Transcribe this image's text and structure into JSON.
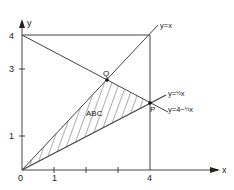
{
  "axes": {
    "x_label": "x",
    "y_label": "y",
    "x_ticks": [
      "0",
      "1",
      "4"
    ],
    "y_ticks": [
      "1",
      "3",
      "4"
    ]
  },
  "lines": {
    "l1": "y=x",
    "l2_pre": "y=",
    "l2_frac": "1/2",
    "l2_post": "x",
    "l3_pre": "y=4−",
    "l3_post": "x"
  },
  "points": {
    "P": "P",
    "Q": "Q"
  },
  "region": "ABC",
  "colors": {
    "line": "#444444",
    "background": "#ffffff"
  }
}
